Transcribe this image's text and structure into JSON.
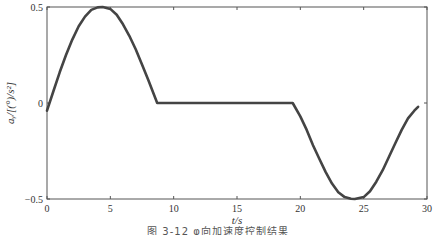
{
  "chart_data": {
    "type": "line",
    "title": "",
    "caption": "图 3-12 φ向加速度控制结果",
    "xlabel": "t/s",
    "ylabel": "aᵧ/[(°)/s²]",
    "xlim": [
      0,
      30
    ],
    "ylim": [
      -0.5,
      0.5
    ],
    "xticks": [
      0,
      5,
      10,
      15,
      20,
      25,
      30
    ],
    "yticks": [
      -0.5,
      0,
      0.5
    ],
    "xtick_labels": [
      "0",
      "5",
      "10",
      "15",
      "20",
      "25",
      "30"
    ],
    "ytick_labels": [
      "−0.5",
      "0",
      "0.5"
    ],
    "grid": false,
    "legend": null,
    "series": [
      {
        "name": "acceleration",
        "color": "#444444",
        "x": [
          0,
          0.5,
          1,
          1.5,
          2,
          2.5,
          3,
          3.5,
          4,
          4.4,
          5,
          5.5,
          6,
          6.5,
          7,
          7.5,
          8,
          8.7,
          10,
          12,
          14,
          16,
          18,
          19.4,
          20,
          20.5,
          21,
          21.5,
          22,
          22.5,
          23,
          23.5,
          24,
          24.3,
          25,
          25.5,
          26,
          26.5,
          27,
          27.5,
          28,
          28.5,
          29,
          29.3
        ],
        "y": [
          -0.04,
          0.06,
          0.16,
          0.25,
          0.33,
          0.4,
          0.45,
          0.485,
          0.498,
          0.5,
          0.49,
          0.46,
          0.41,
          0.35,
          0.28,
          0.2,
          0.12,
          0.0,
          0.0,
          0.0,
          0.0,
          0.0,
          0.0,
          0.0,
          -0.07,
          -0.14,
          -0.22,
          -0.29,
          -0.36,
          -0.42,
          -0.465,
          -0.49,
          -0.499,
          -0.5,
          -0.49,
          -0.46,
          -0.41,
          -0.35,
          -0.28,
          -0.21,
          -0.14,
          -0.08,
          -0.04,
          -0.02
        ]
      }
    ]
  },
  "layout": {
    "plot": {
      "left": 47,
      "top": 7,
      "right": 427,
      "bottom": 199
    }
  }
}
